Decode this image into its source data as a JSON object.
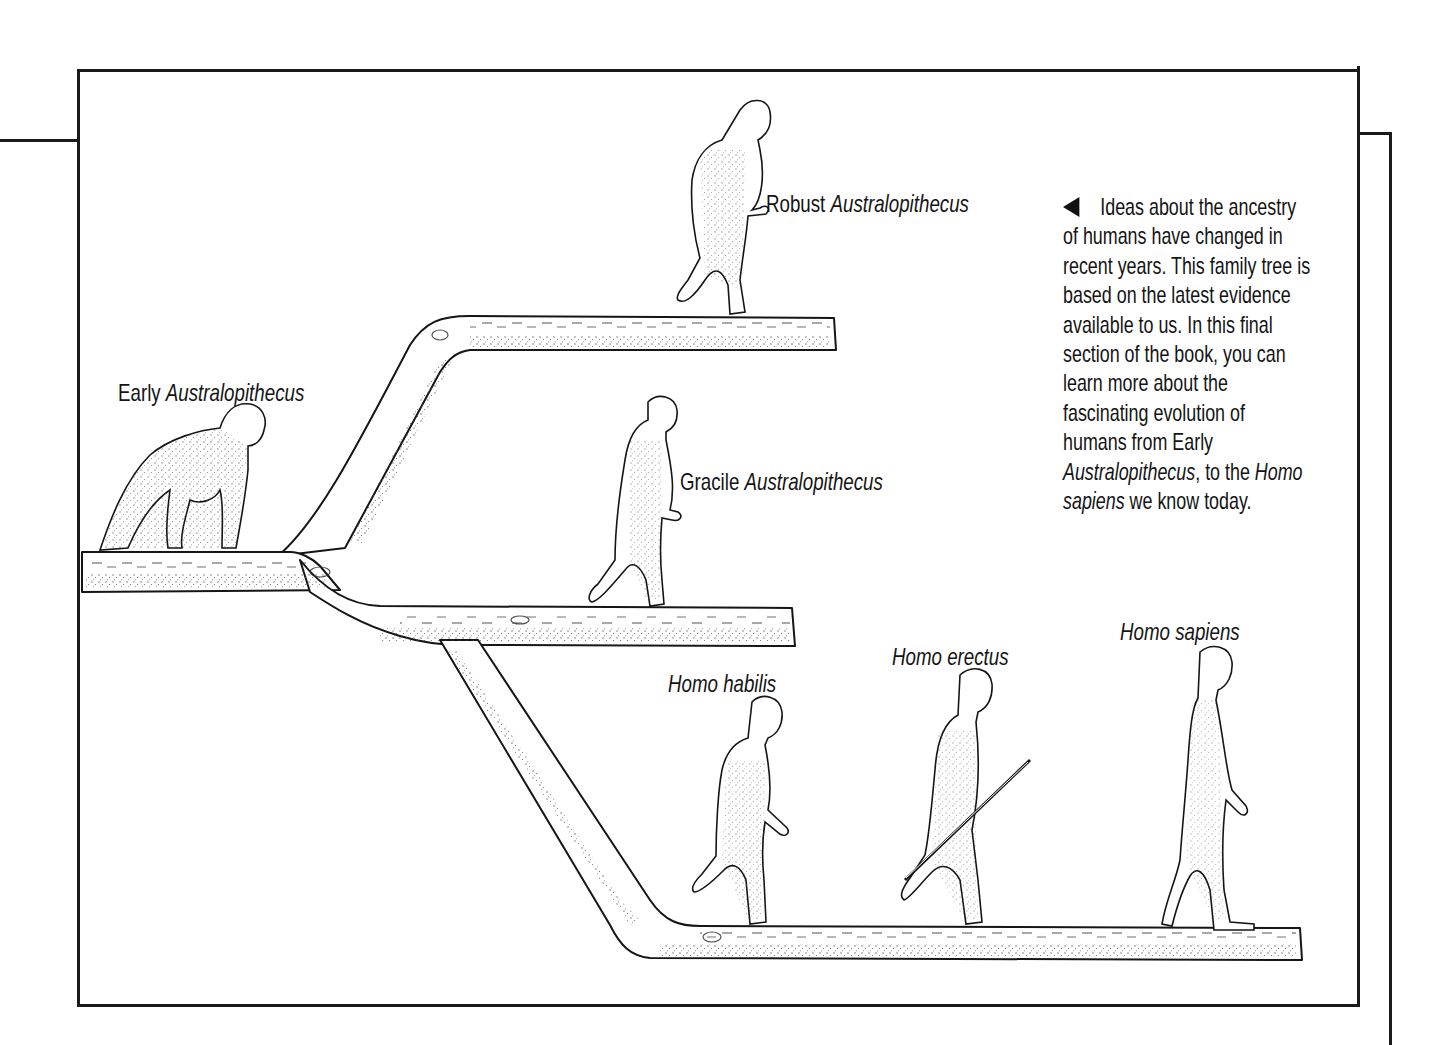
{
  "figure": {
    "labels": {
      "early": {
        "plain": "Early ",
        "italic": "Australopithecus"
      },
      "robust": {
        "plain": "Robust ",
        "italic": "Australopithecus"
      },
      "gracile": {
        "plain": "Gracile ",
        "italic": "Australopithecus"
      },
      "habilis": {
        "plain": "",
        "italic": "Homo habilis"
      },
      "erectus": {
        "plain": "",
        "italic": "Homo erectus"
      },
      "sapiens": {
        "plain": "",
        "italic": "Homo sapiens"
      }
    },
    "caption": {
      "pointer_icon": "left-pointing-triangle",
      "lines": [
        {
          "plain": "Ideas about the ancestry"
        },
        {
          "plain": "of humans have changed in"
        },
        {
          "plain": "recent years. This family tree is"
        },
        {
          "plain": "based on the latest evidence"
        },
        {
          "plain": "available to us. In this final"
        },
        {
          "plain": "section of the book, you can"
        },
        {
          "plain": "learn more about the"
        },
        {
          "plain": "fascinating evolution of"
        },
        {
          "plain": "humans from Early"
        },
        {
          "italic": "Australopithecus",
          "plain": ", to the ",
          "italic2": "Homo"
        },
        {
          "italic": "sapiens",
          "plain": " we know today."
        }
      ]
    },
    "colors": {
      "ink": "#141414",
      "paper": "#ffffff",
      "stipple": "#555555"
    }
  }
}
